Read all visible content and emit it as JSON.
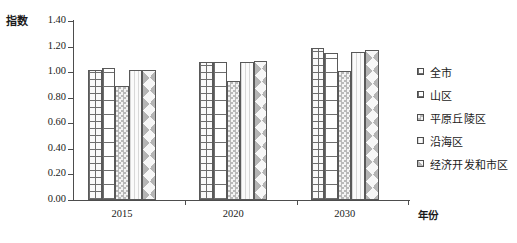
{
  "chart_data": {
    "type": "bar",
    "title": "",
    "ylabel": "指数",
    "xlabel": "年份",
    "categories": [
      "2015",
      "2020",
      "2030"
    ],
    "ylim": [
      0.0,
      1.4
    ],
    "ytick_labels": [
      "0.00",
      "0.20",
      "0.40",
      "0.60",
      "0.80",
      "1.00",
      "1.20",
      "1.40"
    ],
    "ytick_values": [
      0.0,
      0.2,
      0.4,
      0.6,
      0.8,
      1.0,
      1.2,
      1.4
    ],
    "grid": false,
    "legend_position": "right",
    "series": [
      {
        "name": "全市",
        "pattern": "fine-grid",
        "values": [
          1.02,
          1.08,
          1.19
        ]
      },
      {
        "name": "山区",
        "pattern": "coarse-grid",
        "values": [
          1.03,
          1.08,
          1.15
        ]
      },
      {
        "name": "平原丘陵区",
        "pattern": "checker",
        "values": [
          0.89,
          0.93,
          1.01
        ]
      },
      {
        "name": "沿海区",
        "pattern": "vstripe",
        "values": [
          1.02,
          1.08,
          1.16
        ]
      },
      {
        "name": "经济开发和市区",
        "pattern": "diamond",
        "values": [
          1.02,
          1.09,
          1.17
        ]
      }
    ]
  },
  "axes": {
    "y_title": "指数",
    "x_title": "年份"
  },
  "legend": {
    "items": [
      {
        "label": "全市"
      },
      {
        "label": "山区"
      },
      {
        "label": "平原丘陵区"
      },
      {
        "label": "沿海区"
      },
      {
        "label": "经济开发和市区"
      }
    ]
  }
}
